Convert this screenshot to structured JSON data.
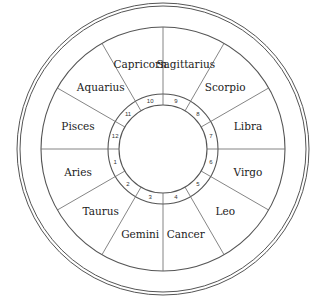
{
  "diagram": {
    "colors": {
      "line": "#555555",
      "text": "#222222",
      "background": "#ffffff"
    },
    "center": [
      163,
      149
    ],
    "radii": {
      "outer_a": 146,
      "outer_b": 143,
      "middle": 122,
      "ring_outer": 55,
      "ring_inner": 44
    },
    "signs": [
      {
        "name": "Aries",
        "house": "1"
      },
      {
        "name": "Taurus",
        "house": "2"
      },
      {
        "name": "Gemini",
        "house": "3"
      },
      {
        "name": "Cancer",
        "house": "4"
      },
      {
        "name": "Leo",
        "house": "5"
      },
      {
        "name": "Virgo",
        "house": "6"
      },
      {
        "name": "Libra",
        "house": "7"
      },
      {
        "name": "Scorpio",
        "house": "8"
      },
      {
        "name": "Sagittarius",
        "house": "9"
      },
      {
        "name": "Capricorn",
        "house": "10"
      },
      {
        "name": "Aquarius",
        "house": "11"
      },
      {
        "name": "Pisces",
        "house": "12"
      }
    ]
  }
}
